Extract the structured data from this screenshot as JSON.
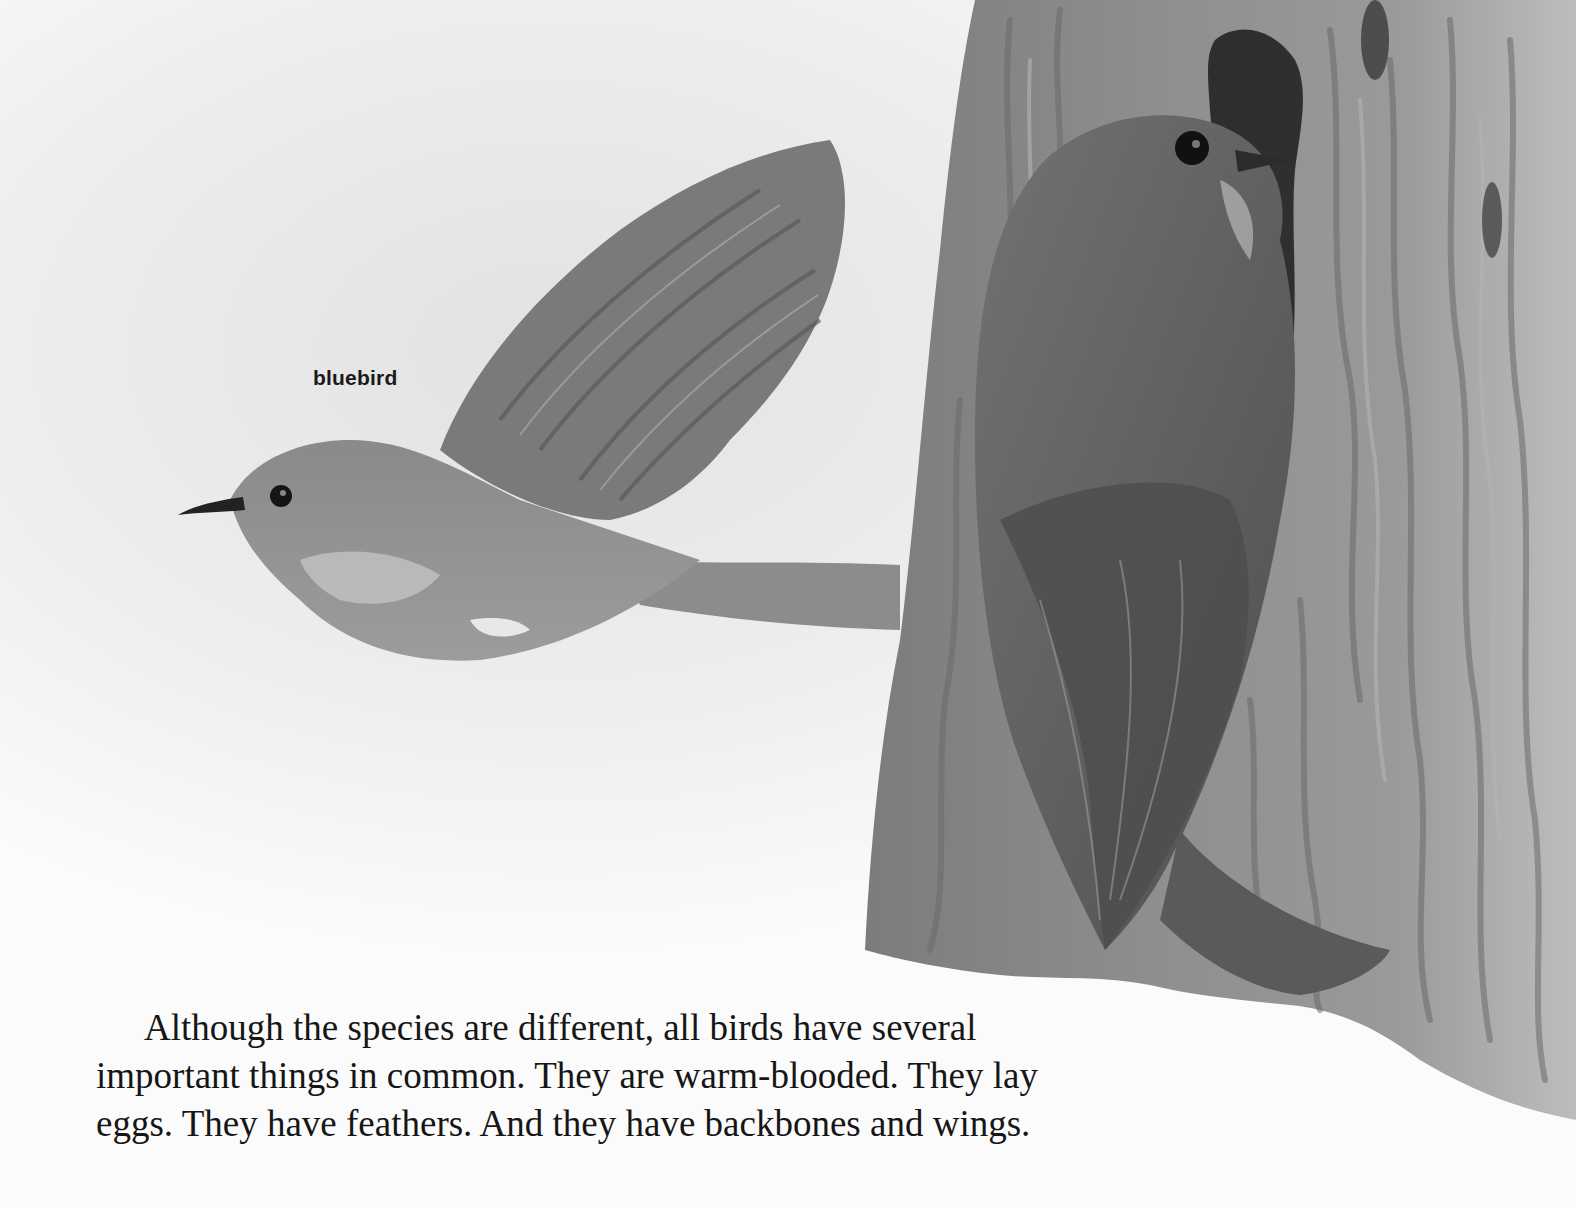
{
  "illustration": {
    "description": "Grayscale watercolor of a bluebird in flight beside a second bird perched at a nest hole on a tree trunk",
    "colors": {
      "paper": "#fbfbfb",
      "sky_wash": "#e4e4e4",
      "trunk": "#8a8a8a",
      "trunk_dark": "#5e5e5e",
      "bird": "#777777",
      "bird_dark": "#4a4a4a",
      "text": "#161616"
    }
  },
  "label": {
    "bluebird": "bluebird"
  },
  "paragraph": {
    "lines": [
      "Although the species are different, all birds have several",
      "important things in common. They are warm-blooded. They lay",
      "eggs. They have feathers. And they have backbones and wings."
    ]
  }
}
